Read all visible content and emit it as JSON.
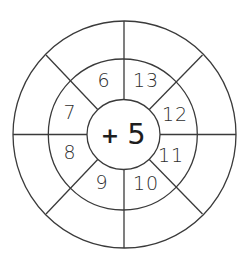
{
  "worksheet": {
    "type": "addition wheel",
    "center": {
      "operator": "+",
      "value": "5"
    },
    "inner_ring_numbers": [
      {
        "position": "top-left",
        "value": "6"
      },
      {
        "position": "top-right",
        "value": "13"
      },
      {
        "position": "right-upper",
        "value": "12"
      },
      {
        "position": "right-lower",
        "value": "11"
      },
      {
        "position": "bottom-right",
        "value": "10"
      },
      {
        "position": "bottom-left",
        "value": "9"
      },
      {
        "position": "left-lower",
        "value": "8"
      },
      {
        "position": "left-upper",
        "value": "7"
      }
    ],
    "outer_ring_answers": [
      "",
      "",
      "",
      "",
      "",
      "",
      "",
      ""
    ],
    "segments": 8,
    "line_color": "#3a3a3a",
    "text_color": "#2e2e2e"
  }
}
